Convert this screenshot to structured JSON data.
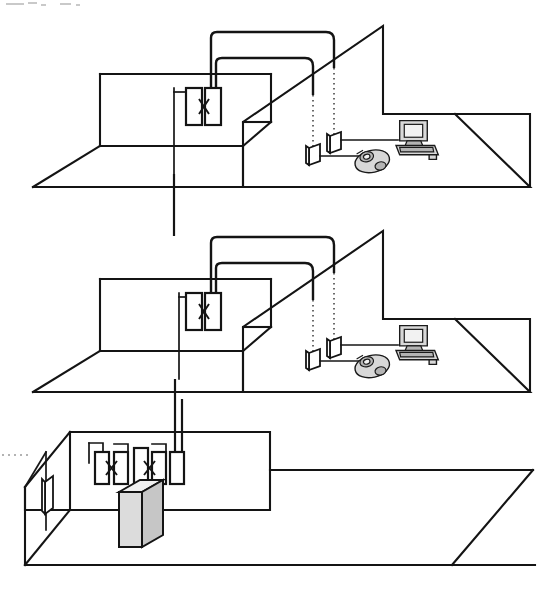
{
  "diagram": {
    "kind": "isometric-building-riser",
    "canvas": {
      "width": 547,
      "height": 589,
      "background": "#ffffff"
    },
    "stroke_color": "#141414",
    "floors": [
      {
        "id": "floor-top",
        "label": "Upper floor telecommunications room",
        "slab": {
          "x": 33,
          "y": 17,
          "width": 497,
          "height": 190
        },
        "equipment": {
          "patch_blocks": 2,
          "cross_connect": "x-bowtie",
          "wall_jacks": 2,
          "devices": [
            "computer-workstation",
            "telephone"
          ]
        },
        "riser_connection": "down"
      },
      {
        "id": "floor-middle",
        "label": "Middle floor telecommunications room",
        "slab": {
          "x": 33,
          "y": 222,
          "width": 497,
          "height": 190
        },
        "equipment": {
          "patch_blocks": 2,
          "cross_connect": "x-bowtie",
          "wall_jacks": 2,
          "devices": [
            "computer-workstation",
            "telephone"
          ]
        },
        "riser_connection": "both"
      },
      {
        "id": "floor-ground",
        "label": "Main equipment room",
        "slab": {
          "x": 12,
          "y": 430,
          "width": 520,
          "height": 150
        },
        "equipment": {
          "patch_blocks": 5,
          "cross_connect": "x-bowtie",
          "wall_jacks": 1,
          "devices": [
            "equipment-cabinet"
          ]
        },
        "riser_connection": "up"
      }
    ],
    "icons": {
      "computer": "computer-workstation-icon",
      "telephone": "telephone-icon",
      "cabinet": "equipment-cabinet-icon",
      "jack": "wall-jack-icon",
      "patch_block": "patch-block-icon",
      "cross_connect": "cross-connect-x-icon",
      "riser": "riser-cable-icon",
      "horizontal_cable": "horizontal-cable-icon"
    },
    "legend_text": ""
  }
}
